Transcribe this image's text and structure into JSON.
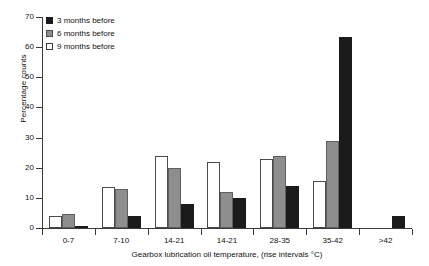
{
  "chart_data": {
    "type": "bar",
    "title": "",
    "xlabel": "Gearbox lubrication oil temperature, (rise intervals °C)",
    "ylabel": "Percentage counts",
    "categories": [
      "0-7",
      "7-10",
      "14-21",
      "14-21",
      "28-35",
      "35-42",
      ">42"
    ],
    "series": [
      {
        "name": "9 months before",
        "color": "#ffffff",
        "values": [
          4,
          13.5,
          24,
          22,
          23,
          15.5,
          0
        ]
      },
      {
        "name": "6 months before",
        "color": "#8e8e8e",
        "values": [
          4.5,
          13,
          20,
          12,
          24,
          29,
          0
        ]
      },
      {
        "name": "3 months before",
        "color": "#1b1b1b",
        "values": [
          0.7,
          4,
          8,
          10,
          14,
          63.5,
          4
        ]
      }
    ],
    "ylim": [
      0,
      70
    ],
    "yticks": [
      0,
      10,
      20,
      30,
      40,
      50,
      60,
      70
    ],
    "ytick_labels": [
      "0",
      "10",
      "20",
      "30",
      "40",
      "50",
      "60",
      "70"
    ],
    "grid": false,
    "legend_position": "top-left"
  },
  "legend": {
    "items": [
      {
        "label": "3 months before",
        "swatch": "legend-swatch-black"
      },
      {
        "label": "6 months before",
        "swatch": "legend-swatch-gray"
      },
      {
        "label": "9 months before",
        "swatch": "legend-swatch-white"
      }
    ]
  }
}
